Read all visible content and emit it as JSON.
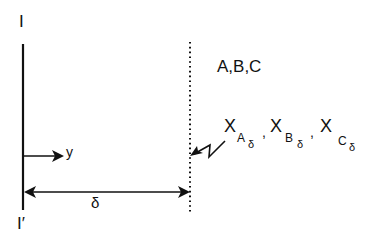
{
  "diagram": {
    "labels": {
      "interface_top": "I",
      "interface_bottom": "I′",
      "y_axis": "y",
      "delta": "δ",
      "species": "A,B,C"
    },
    "concentrations": [
      {
        "base": "X",
        "sub": "A",
        "subsub": "δ"
      },
      {
        "base": "X",
        "sub": "B",
        "subsub": "δ"
      },
      {
        "base": "X",
        "sub": "C",
        "subsub": "δ"
      }
    ],
    "separator": ","
  }
}
